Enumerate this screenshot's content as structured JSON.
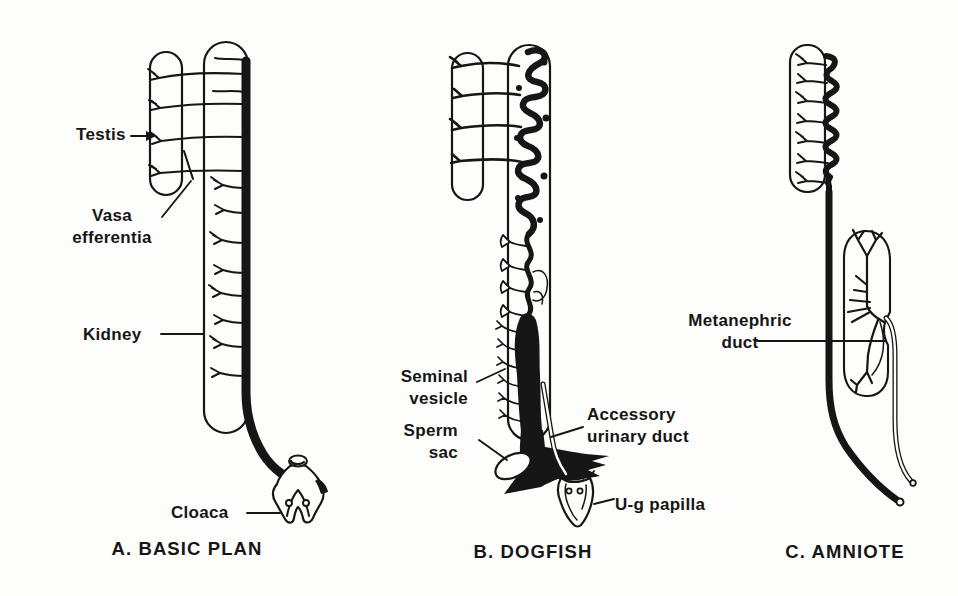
{
  "figure_title": "Male urogenital duct diagrams",
  "colors": {
    "ink": "#161616",
    "paper": "#fdfdfc"
  },
  "panels": [
    {
      "id": "basic-plan",
      "caption": "A. BASIC PLAN",
      "labels": {
        "testis": "Testis",
        "vasa": "Vasa efferentia",
        "kidney": "Kidney",
        "cloaca": "Cloaca"
      }
    },
    {
      "id": "dogfish",
      "caption": "B. DOGFISH",
      "labels": {
        "seminal": "Seminal vesicle",
        "sperm": "Sperm sac",
        "accessory": "Accessory urinary duct",
        "ug": "U-g papilla"
      }
    },
    {
      "id": "amniote",
      "caption": "C. AMNIOTE",
      "labels": {
        "metanephric": "Metanephric duct"
      }
    }
  ]
}
